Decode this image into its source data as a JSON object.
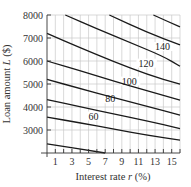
{
  "chart_data": {
    "type": "line",
    "title": "",
    "xlabel": "Interest rate r (%)",
    "ylabel": "Loan amount L ($)",
    "xlim": [
      0,
      16
    ],
    "ylim": [
      2000,
      8000
    ],
    "x_ticks": [
      1,
      3,
      5,
      7,
      9,
      11,
      13,
      15
    ],
    "x_tick_labels": [
      "1",
      "3",
      "5",
      "7",
      "9",
      "11",
      "13",
      "15"
    ],
    "y_ticks": [
      3000,
      4000,
      5000,
      6000,
      7000,
      8000
    ],
    "y_tick_labels": [
      "3000",
      "4000",
      "5000",
      "6000",
      "7000",
      "8000"
    ],
    "grid": true,
    "grid_x_step": 1,
    "grid_y_step": 1000,
    "series": [
      {
        "name": "40",
        "label": "",
        "points": [
          [
            0,
            2400
          ],
          [
            7,
            2000
          ]
        ]
      },
      {
        "name": "60",
        "label": "60",
        "label_at": [
          5,
          3500
        ],
        "points": [
          [
            0,
            3560
          ],
          [
            4,
            3310
          ],
          [
            8,
            3040
          ],
          [
            12,
            2780
          ],
          [
            16,
            2560
          ]
        ]
      },
      {
        "name": "80",
        "label": "80",
        "label_at": [
          7,
          4250
        ],
        "points": [
          [
            0,
            4320
          ],
          [
            4,
            4010
          ],
          [
            8,
            3700
          ],
          [
            12,
            3400
          ],
          [
            16,
            3060
          ]
        ]
      },
      {
        "name": "100",
        "label": "100",
        "label_at": [
          9,
          5020
        ],
        "points": [
          [
            0,
            5200
          ],
          [
            4,
            4800
          ],
          [
            8,
            4410
          ],
          [
            12,
            4030
          ],
          [
            16,
            3650
          ]
        ]
      },
      {
        "name": "120",
        "label": "120",
        "label_at": [
          11,
          5800
        ],
        "points": [
          [
            0,
            6000
          ],
          [
            4,
            5580
          ],
          [
            8,
            5130
          ],
          [
            12,
            4710
          ],
          [
            16,
            4300
          ]
        ]
      },
      {
        "name": "140",
        "label": "140",
        "label_at": [
          13,
          6520
        ],
        "points": [
          [
            0,
            7200
          ],
          [
            4,
            6580
          ],
          [
            8,
            5980
          ],
          [
            12,
            5420
          ],
          [
            16,
            4990
          ]
        ]
      },
      {
        "name": "160",
        "label": "",
        "points": [
          [
            2.2,
            8000
          ],
          [
            6,
            7400
          ],
          [
            10,
            6800
          ],
          [
            14,
            6200
          ],
          [
            16,
            5770
          ]
        ]
      },
      {
        "name": "180",
        "label": "",
        "points": [
          [
            7.5,
            8000
          ],
          [
            12,
            7250
          ],
          [
            16,
            6700
          ]
        ]
      },
      {
        "name": "200",
        "label": "",
        "points": [
          [
            12.8,
            8000
          ],
          [
            16,
            7480
          ]
        ]
      }
    ]
  }
}
